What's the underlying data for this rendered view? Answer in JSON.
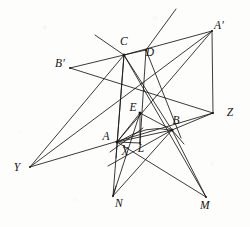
{
  "figure": {
    "background_color": "#fdfdfc",
    "stroke_color": "#1a1815",
    "width": 250,
    "height": 227
  },
  "labels": [
    {
      "id": "C",
      "text": "C",
      "x": 124,
      "y": 42
    },
    {
      "id": "D",
      "text": "D",
      "x": 150,
      "y": 53
    },
    {
      "id": "Ap",
      "text": "A'",
      "x": 219,
      "y": 26
    },
    {
      "id": "Bp",
      "text": "B'",
      "x": 60,
      "y": 64
    },
    {
      "id": "E",
      "text": "E",
      "x": 133,
      "y": 108
    },
    {
      "id": "B",
      "text": "B",
      "x": 176,
      "y": 121
    },
    {
      "id": "Z",
      "text": "Z",
      "x": 230,
      "y": 113
    },
    {
      "id": "A",
      "text": "A",
      "x": 106,
      "y": 137
    },
    {
      "id": "X",
      "text": "X",
      "x": 125,
      "y": 152
    },
    {
      "id": "L",
      "text": "L",
      "x": 141,
      "y": 149
    },
    {
      "id": "Y",
      "text": "Y",
      "x": 17,
      "y": 168
    },
    {
      "id": "N",
      "text": "N",
      "x": 119,
      "y": 204
    },
    {
      "id": "M",
      "text": "M",
      "x": 205,
      "y": 206
    }
  ],
  "points": {
    "C": [
      124,
      55
    ],
    "D": [
      146,
      50
    ],
    "Ap": [
      212,
      31
    ],
    "Bp": [
      70,
      68
    ],
    "E": [
      140,
      113
    ],
    "B": [
      172,
      130
    ],
    "Z": [
      213,
      113
    ],
    "A": [
      117,
      142
    ],
    "X": [
      124,
      146
    ],
    "L": [
      140,
      143
    ],
    "Y": [
      30,
      167
    ],
    "N": [
      113,
      196
    ],
    "M": [
      206,
      197
    ]
  },
  "segments": [
    {
      "name": "C-N",
      "from": [
        124,
        55
      ],
      "to": [
        113,
        196
      ]
    },
    {
      "name": "C-A-ext",
      "from": [
        124,
        55
      ],
      "to": [
        116,
        158
      ]
    },
    {
      "name": "C-M",
      "from": [
        124,
        55
      ],
      "to": [
        206,
        197
      ]
    },
    {
      "name": "C-B",
      "from": [
        124,
        55
      ],
      "to": [
        172,
        130
      ]
    },
    {
      "name": "C-Bp",
      "from": [
        124,
        55
      ],
      "to": [
        70,
        68
      ]
    },
    {
      "name": "C-Y",
      "from": [
        124,
        55
      ],
      "to": [
        30,
        167
      ]
    },
    {
      "name": "C-upleft",
      "from": [
        124,
        55
      ],
      "to": [
        95,
        35
      ]
    },
    {
      "name": "C-Ap",
      "from": [
        124,
        55
      ],
      "to": [
        212,
        31
      ]
    },
    {
      "name": "C-D-Ap-top",
      "from": [
        124,
        55
      ],
      "to": [
        146,
        50
      ]
    },
    {
      "name": "D-L",
      "from": [
        146,
        50
      ],
      "to": [
        140,
        143
      ]
    },
    {
      "name": "D-steep-up",
      "from": [
        146,
        50
      ],
      "to": [
        176,
        9
      ]
    },
    {
      "name": "D-to-B-low",
      "from": [
        146,
        50
      ],
      "to": [
        181,
        138
      ]
    },
    {
      "name": "Ap-A",
      "from": [
        212,
        31
      ],
      "to": [
        117,
        142
      ]
    },
    {
      "name": "Ap-Z",
      "from": [
        212,
        31
      ],
      "to": [
        213,
        113
      ]
    },
    {
      "name": "Bp-Z",
      "from": [
        70,
        68
      ],
      "to": [
        213,
        113
      ]
    },
    {
      "name": "Y-Ap-line",
      "from": [
        30,
        167
      ],
      "to": [
        212,
        31
      ]
    },
    {
      "name": "Y-Z-line",
      "from": [
        30,
        167
      ],
      "to": [
        213,
        113
      ]
    },
    {
      "name": "A-B",
      "from": [
        117,
        142
      ],
      "to": [
        172,
        130
      ]
    },
    {
      "name": "A-M",
      "from": [
        117,
        142
      ],
      "to": [
        206,
        197
      ]
    },
    {
      "name": "A-upright",
      "from": [
        110,
        152
      ],
      "to": [
        143,
        128
      ]
    },
    {
      "name": "A-E",
      "from": [
        117,
        142
      ],
      "to": [
        140,
        113
      ]
    },
    {
      "name": "E-B",
      "from": [
        140,
        113
      ],
      "to": [
        172,
        130
      ]
    },
    {
      "name": "E-N",
      "from": [
        140,
        113
      ],
      "to": [
        113,
        196
      ]
    },
    {
      "name": "B-N",
      "from": [
        172,
        130
      ],
      "to": [
        113,
        196
      ]
    },
    {
      "name": "B-M",
      "from": [
        172,
        130
      ],
      "to": [
        206,
        197
      ]
    },
    {
      "name": "B-lowleft",
      "from": [
        172,
        130
      ],
      "to": [
        108,
        166
      ]
    },
    {
      "name": "B-Z",
      "from": [
        172,
        130
      ],
      "to": [
        213,
        113
      ]
    },
    {
      "name": "B-short-se",
      "from": [
        172,
        130
      ],
      "to": [
        184,
        144
      ]
    },
    {
      "name": "E-L-vert",
      "from": [
        140,
        113
      ],
      "to": [
        140,
        143
      ]
    },
    {
      "name": "A-L-base",
      "from": [
        117,
        142
      ],
      "to": [
        140,
        143
      ]
    },
    {
      "name": "N-bot-stub",
      "from": [
        113,
        196
      ],
      "to": [
        116,
        186
      ]
    }
  ],
  "arc": {
    "name": "arc-A-to-B",
    "path": "M 120 141 Q 147 124 170 130"
  }
}
